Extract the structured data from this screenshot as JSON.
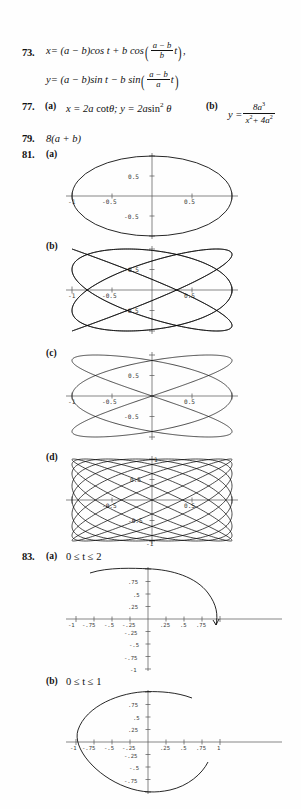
{
  "page": {
    "kind": "textbook-answer-key",
    "background": "#fefefe",
    "ink": "#111111"
  },
  "exercises": [
    {
      "number": "73.",
      "lines": [
        "x = (a − b)cos t + b cos((a−b)/b t),",
        "y = (a − b)sin t − b sin((a−b)/a t)"
      ]
    },
    {
      "number": "77.",
      "part_a_label": "(a)",
      "part_a": "x = 2a cot θ;  y = 2a sin² θ",
      "part_b_label": "(b)",
      "part_b": "y = 8a³ / (x² + 4a²)"
    },
    {
      "number": "79.",
      "answer": "8(a + b)"
    },
    {
      "number": "81.",
      "part_labels": [
        "(a)",
        "(b)",
        "(c)",
        "(d)"
      ]
    },
    {
      "number": "83.",
      "part_a_label": "(a)",
      "part_a_domain": "0 ≤ t ≤ 2",
      "part_b_label": "(b)",
      "part_b_domain": "0 ≤ t ≤ 1"
    }
  ],
  "eq73": {
    "x_lhs": "x",
    "x_rhs_1": "= (a − b)cos t + b cos",
    "x_frac_top": "a − b",
    "x_frac_bot": "b",
    "x_tail": "t",
    "x_end": ",",
    "y_lhs": "y",
    "y_rhs_1": "= (a − b)sin t − b sin",
    "y_frac_top": "a − b",
    "y_frac_bot": "a",
    "y_tail": "t"
  },
  "eq77": {
    "number": "77.",
    "a_label": "(a)",
    "a_text_1": "x = 2a",
    "a_text_2": "cot",
    "a_text_3": "θ;",
    "a_text_4": "y = 2a",
    "a_text_5": "sin",
    "a_text_6": "2",
    "a_text_7": "θ",
    "b_label": "(b)",
    "b_lhs": "y =",
    "b_num": "8a",
    "b_num_sup": "3",
    "b_den_1": "x",
    "b_den_sup1": "2",
    "b_den_2": "+ 4a",
    "b_den_sup2": "2"
  },
  "eq79": {
    "number": "79.",
    "answer": "8(a + b)"
  },
  "eq81": {
    "number": "81.",
    "a_label": "(a)",
    "b_label": "(b)",
    "c_label": "(c)",
    "d_label": "(d)"
  },
  "eq83": {
    "number": "83.",
    "a_label": "(a)",
    "a_domain": "0 ≤ t ≤ 2",
    "b_label": "(b)",
    "b_domain": "0 ≤ t ≤ 1"
  },
  "chart_data": [
    {
      "id": "plot-81a",
      "type": "line",
      "title": "81 (a)",
      "curve": "lissajous",
      "lobes_x": 1,
      "lobes_y": 1,
      "description": "single closed oval / ellipse inscribed in the unit box",
      "xlim": [
        -1.15,
        1.15
      ],
      "ylim": [
        -1.15,
        1.15
      ],
      "xticks": [
        -1,
        -0.5,
        0.5,
        1
      ],
      "xtick_labels": [
        "-1",
        "-0.5",
        "0.5",
        "1"
      ],
      "xtick_labels_shown": [
        "-1",
        "-0.5",
        "0.5"
      ],
      "yticks": [
        -1,
        -0.5,
        0.5,
        1
      ],
      "ytick_labels_shown": [
        "0.5",
        "-0.5"
      ],
      "grid": false,
      "legend": "none"
    },
    {
      "id": "plot-81b",
      "type": "line",
      "title": "81 (b)",
      "curve": "lissajous",
      "lobes_x": 6,
      "lobes_y": 5,
      "description": "dense woven Lissajous mesh filling the unit box",
      "xlim": [
        -1.15,
        1.15
      ],
      "ylim": [
        -1.15,
        1.15
      ],
      "xticks": [
        -1,
        -0.5,
        0.5,
        1
      ],
      "xtick_labels_shown": [
        "-1",
        "-0.5",
        "0.5"
      ],
      "yticks": [
        -1,
        -0.5,
        0.5,
        1
      ],
      "ytick_labels_shown": [
        "0.5",
        "-0.5"
      ],
      "grid": false,
      "legend": "none"
    },
    {
      "id": "plot-81c",
      "type": "line",
      "title": "81 (c)",
      "curve": "lissajous",
      "lobes_x": 3,
      "lobes_y": 2,
      "description": "three-lobe Lissajous figure crossing the x-axis near -0.5 and 0.5",
      "xlim": [
        -1.15,
        1.15
      ],
      "ylim": [
        -1.15,
        1.15
      ],
      "xticks": [
        -1,
        -0.5,
        0.5,
        1
      ],
      "xtick_labels_shown": [
        "-1",
        "-0.5",
        "0.5"
      ],
      "yticks": [
        -1,
        -0.5,
        0.5,
        1
      ],
      "ytick_labels_shown": [
        "0.5",
        "-0.5"
      ],
      "grid": false,
      "legend": "none"
    },
    {
      "id": "plot-81d",
      "type": "line",
      "title": "81 (d)",
      "curve": "lissajous",
      "lobes_x": 9,
      "lobes_y": 8,
      "description": "many-lobed Lissajous braid filling the unit box",
      "xlim": [
        -1.15,
        1.15
      ],
      "ylim": [
        -1.15,
        1.15
      ],
      "xticks": [
        -1,
        -0.5,
        0.5,
        1
      ],
      "xtick_labels_shown": [
        "-0.5",
        "0.5"
      ],
      "yticks": [
        -1,
        -0.5,
        0.5,
        1
      ],
      "ytick_labels_shown": [
        "1",
        "0.5",
        "-0.5",
        "-1"
      ],
      "grid": false,
      "legend": "none"
    },
    {
      "id": "plot-83a",
      "type": "line",
      "title": "83 (a)",
      "curve": "arc",
      "description": "upper arc from about (-0.8, 0.97) over the top (0,1) sweeping right and down to about (0.82,-0.1)",
      "t_range": [
        0,
        2
      ],
      "xlim": [
        -1.15,
        1.1
      ],
      "ylim": [
        -1.15,
        1.15
      ],
      "xticks": [
        -1,
        -0.75,
        -0.5,
        -0.25,
        0.25,
        0.5,
        0.75
      ],
      "xtick_labels": [
        "-1",
        "-.75",
        "-.5",
        "-.25",
        ".25",
        ".5",
        ".75"
      ],
      "yticks": [
        -1,
        -0.75,
        -0.5,
        -0.25,
        0.25,
        0.5,
        0.75,
        1
      ],
      "ytick_labels": [
        ".75",
        ".5",
        ".25",
        "-.25",
        "-.5",
        "-.75",
        "-1"
      ],
      "grid": false,
      "legend": "none"
    },
    {
      "id": "plot-83b",
      "type": "line",
      "title": "83 (b)",
      "curve": "oval-open",
      "description": "near-closed oval spanning -1..1 in x and -1..1 in y with a gap on the right side",
      "t_range": [
        0,
        1
      ],
      "xlim": [
        -1.15,
        1.15
      ],
      "ylim": [
        -1.15,
        1.15
      ],
      "xticks": [
        -1,
        -0.75,
        -0.5,
        -0.25,
        0.25,
        0.5,
        0.75,
        1
      ],
      "xtick_labels": [
        "-1",
        "-.75",
        "-.5",
        "-.25",
        ".25",
        ".5",
        ".75",
        "1"
      ],
      "yticks": [
        -1,
        -0.75,
        -0.5,
        -0.25,
        0.25,
        0.5,
        0.75,
        1
      ],
      "ytick_labels": [
        ".75",
        ".5",
        ".25",
        "-.25",
        "-.5",
        "-.75"
      ],
      "grid": false,
      "legend": "none"
    }
  ]
}
